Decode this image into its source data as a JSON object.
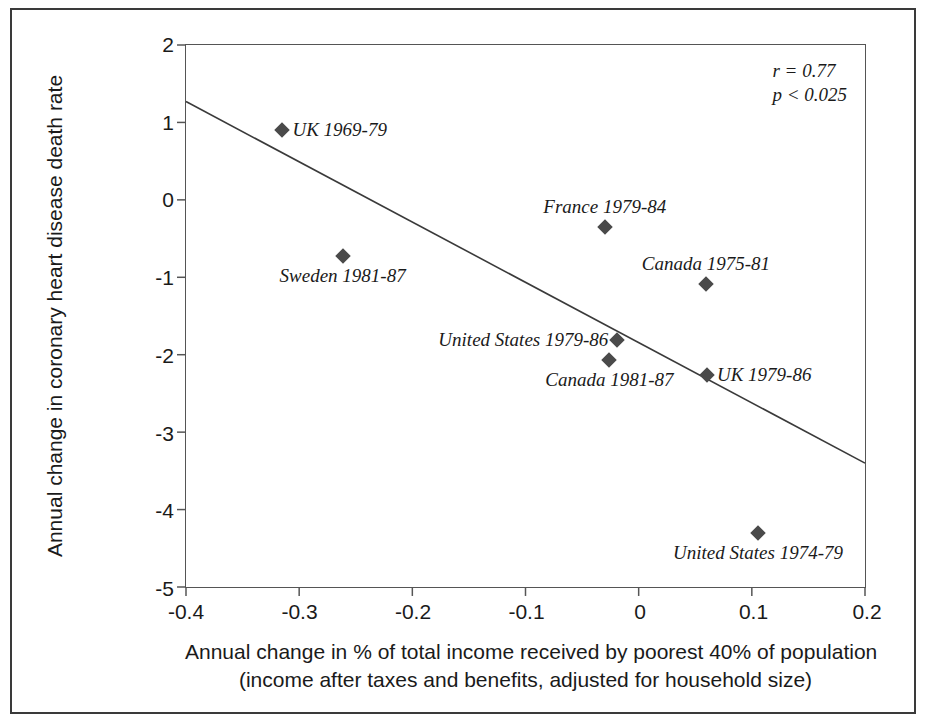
{
  "chart_data": {
    "type": "scatter",
    "title": "",
    "xlabel": "Annual change in % of total income received by poorest 40% of population",
    "xlabel_line2": "(income after taxes and benefits, adjusted for household size)",
    "ylabel": "Annual change in coronary heart disease death rate",
    "xlim": [
      -0.4,
      0.2
    ],
    "ylim": [
      -5,
      2
    ],
    "xticks": [
      "-0.4",
      "-0.3",
      "-0.2",
      "-0.1",
      "0",
      "0.1",
      "0.2"
    ],
    "xtick_values": [
      -0.4,
      -0.3,
      -0.2,
      -0.1,
      0,
      0.1,
      0.2
    ],
    "yticks": [
      "2",
      "1",
      "0",
      "-1",
      "-2",
      "-3",
      "-4",
      "-5"
    ],
    "ytick_values": [
      2,
      1,
      0,
      -1,
      -2,
      -3,
      -4,
      -5
    ],
    "grid": false,
    "legend": "none",
    "annotations": {
      "r_label": "r = 0.77",
      "p_label": "p < 0.025"
    },
    "trendline": {
      "x": [
        -0.4,
        0.2
      ],
      "y": [
        1.27,
        -3.4
      ]
    },
    "points": [
      {
        "label": "UK 1969-79",
        "x": -0.315,
        "y": 0.9,
        "label_pos": "right"
      },
      {
        "label": "Sweden 1981-87",
        "x": -0.262,
        "y": -0.72,
        "label_pos": "below"
      },
      {
        "label": "France 1979-84",
        "x": -0.031,
        "y": -0.34,
        "label_pos": "above"
      },
      {
        "label": "Canada 1975-81",
        "x": 0.058,
        "y": -1.08,
        "label_pos": "above"
      },
      {
        "label": "United States 1979-86",
        "x": -0.02,
        "y": -1.8,
        "label_pos": "left"
      },
      {
        "label": "Canada 1981-87",
        "x": -0.027,
        "y": -2.05,
        "label_pos": "below"
      },
      {
        "label": "UK 1979-86",
        "x": 0.059,
        "y": -2.25,
        "label_pos": "right"
      },
      {
        "label": "United States 1974-79",
        "x": 0.104,
        "y": -4.28,
        "label_pos": "below"
      }
    ]
  }
}
